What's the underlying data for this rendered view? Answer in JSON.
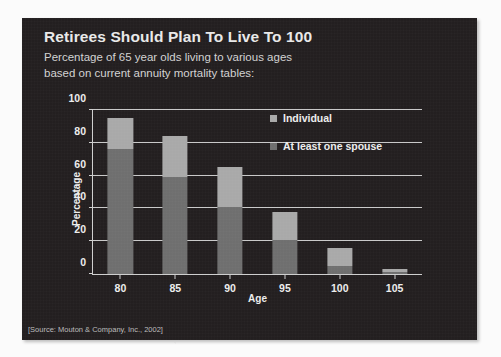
{
  "slide": {
    "title": "Retirees Should Plan To Live To 100",
    "subtitle_line_1": "Percentage of 65 year olds living to various ages",
    "subtitle_line_2": "based on current annuity mortality tables:",
    "source_note": "[Source: Mouton & Company, Inc., 2002]",
    "background_color": "#231f20",
    "text_color": "#e9e9e9"
  },
  "chart_data": {
    "type": "bar",
    "subtype": "stacked",
    "title": "Retirees Should Plan To Live To 100",
    "subtitle": "Percentage of 65 year olds living to various ages based on current annuity mortality tables:",
    "xlabel": "Age",
    "ylabel": "Percentage",
    "categories": [
      "80",
      "85",
      "90",
      "95",
      "100",
      "105"
    ],
    "ylim": [
      0,
      100
    ],
    "yticks": [
      0,
      20,
      40,
      60,
      80,
      100
    ],
    "grid": true,
    "legend_position": "top-right",
    "series": [
      {
        "name": "At least one spouse",
        "color": "#a9a9a9",
        "values": [
          95,
          84,
          65,
          38,
          16,
          3
        ]
      },
      {
        "name": "Individual",
        "color": "#6f6f6f",
        "values": [
          76,
          59,
          41,
          21,
          5,
          1
        ]
      }
    ],
    "annotation": "[Source: Mouton & Company, Inc., 2002]"
  },
  "legend": [
    {
      "label": "Individual",
      "color": "#a9a9a9"
    },
    {
      "label": "At least one spouse",
      "color": "#6f6f6f"
    }
  ]
}
